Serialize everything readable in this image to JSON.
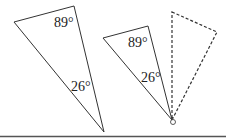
{
  "diagram": {
    "triangle_original": {
      "vertices": [
        [
          14,
          22
        ],
        [
          74,
          6
        ],
        [
          104,
          132
        ]
      ],
      "angle_top": "89°",
      "angle_bottom": "26°"
    },
    "triangle_copy": {
      "vertices": [
        [
          103,
          38
        ],
        [
          148,
          26
        ],
        [
          172,
          120
        ]
      ],
      "angle_top": "89°",
      "angle_bottom": "26°"
    },
    "triangle_rotated_dashed": {
      "vertices": [
        [
          172,
          12
        ],
        [
          217,
          32
        ],
        [
          172,
          120
        ]
      ]
    },
    "rotation_center": [
      172,
      121
    ],
    "colors": {
      "stroke": "#333333",
      "baseline": "#555555"
    }
  }
}
